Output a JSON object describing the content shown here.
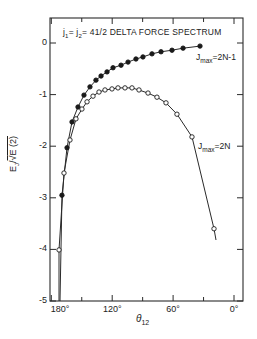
{
  "chart_data": {
    "type": "line",
    "title_parts": {
      "j1": "j",
      "sub1": "1",
      "eq1": "= j",
      "sub2": "2",
      "rest": "= 41/2  DELTA  FORCE  SPECTRUM"
    },
    "xlabel": "θ12",
    "xlabel_parts": {
      "main": "θ",
      "sub": "12"
    },
    "ylabel": "E_J / √E(2)",
    "ylabel_parts": {
      "main": "E",
      "sub": "J",
      "slash": "/",
      "denom": "E (2)"
    },
    "xlim": [
      180,
      0
    ],
    "ylim": [
      -5,
      0.4
    ],
    "x_ticks": [
      180,
      120,
      60,
      0
    ],
    "x_tick_labels": [
      "180°",
      "120°",
      "60°",
      "0°"
    ],
    "x_minor_ticks": [
      150,
      90,
      30
    ],
    "y_ticks": [
      0,
      -1,
      -2,
      -3,
      -4,
      -5
    ],
    "y_tick_labels": [
      "0",
      "-1",
      "-2",
      "-3",
      "-4",
      "-5"
    ],
    "grid": false,
    "legend": "inline labels at curve ends",
    "series": [
      {
        "name": "Jmax=2N-1",
        "label_main": "J",
        "label_sub": "max",
        "label_rest": "=2N-1",
        "marker": "filled-circle",
        "points": [
          [
            33.5,
            -0.06
          ],
          [
            50.2,
            -0.1
          ],
          [
            61.1,
            -0.14
          ],
          [
            71.9,
            -0.17
          ],
          [
            80.8,
            -0.21
          ],
          [
            89.7,
            -0.27
          ],
          [
            96.6,
            -0.31
          ],
          [
            104.4,
            -0.37
          ],
          [
            111.3,
            -0.43
          ],
          [
            119.2,
            -0.48
          ],
          [
            125.1,
            -0.56
          ],
          [
            131.0,
            -0.64
          ],
          [
            136.0,
            -0.72
          ],
          [
            141.9,
            -0.85
          ],
          [
            147.8,
            -1.01
          ],
          [
            153.7,
            -1.24
          ],
          [
            159.6,
            -1.53
          ],
          [
            164.5,
            -2.03
          ],
          [
            169.5,
            -2.95
          ]
        ]
      },
      {
        "name": "Jmax=2N",
        "label_main": "J",
        "label_sub": "max",
        "label_rest": "=2N",
        "marker": "open-circle",
        "points": [
          [
            19.7,
            -3.6
          ],
          [
            41.4,
            -1.82
          ],
          [
            56.2,
            -1.38
          ],
          [
            67.0,
            -1.16
          ],
          [
            75.9,
            -1.05
          ],
          [
            84.7,
            -0.97
          ],
          [
            93.6,
            -0.91
          ],
          [
            100.5,
            -0.87
          ],
          [
            107.4,
            -0.87
          ],
          [
            114.3,
            -0.87
          ],
          [
            120.2,
            -0.89
          ],
          [
            127.1,
            -0.91
          ],
          [
            133.0,
            -0.95
          ],
          [
            138.9,
            -1.03
          ],
          [
            144.8,
            -1.14
          ],
          [
            149.8,
            -1.28
          ],
          [
            155.7,
            -1.47
          ],
          [
            161.6,
            -1.88
          ],
          [
            167.5,
            -2.52
          ],
          [
            172.4,
            -4.01
          ]
        ]
      }
    ]
  }
}
